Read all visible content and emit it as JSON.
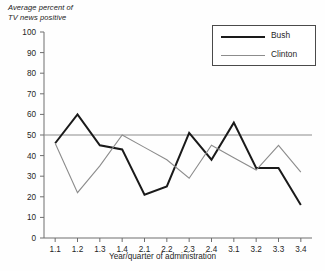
{
  "chart_data": {
    "type": "line",
    "title": "",
    "ylabel": "Average percent of\nTV news positive",
    "xlabel": "Year/quarter of administration",
    "categories": [
      "1.1",
      "1.2",
      "1.3",
      "1.4",
      "2.1",
      "2.2",
      "2.3",
      "2.4",
      "3.1",
      "3.2",
      "3.3",
      "3.4"
    ],
    "ylim": [
      0,
      100
    ],
    "yticks": [
      0,
      10,
      20,
      30,
      40,
      50,
      60,
      70,
      80,
      90,
      100
    ],
    "grid": false,
    "legend_position": "top-right",
    "reference_line": {
      "value": 50,
      "color": "#8c8c8c"
    },
    "series": [
      {
        "name": "Bush",
        "color": "#1a1a1a",
        "width": 2,
        "values": [
          46,
          60,
          45,
          43,
          21,
          25,
          51,
          38,
          56,
          34,
          34,
          16
        ]
      },
      {
        "name": "Clinton",
        "color": "#8c8c8c",
        "width": 1.1,
        "values": [
          46,
          22,
          35,
          50,
          44,
          38,
          29,
          45,
          39,
          33,
          45,
          32
        ]
      }
    ]
  },
  "legend": {
    "entries": [
      {
        "label": "Bush",
        "swatch": "bush-line-swatch"
      },
      {
        "label": "Clinton",
        "swatch": "clinton-line-swatch"
      }
    ]
  }
}
